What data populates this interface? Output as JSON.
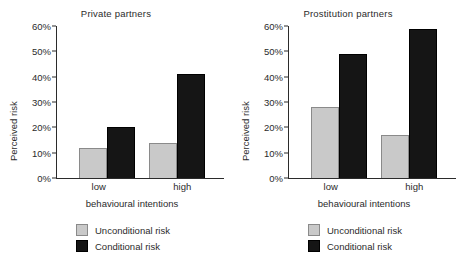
{
  "chart_data": [
    {
      "type": "bar",
      "title": "Private partners",
      "xlabel": "behavioural intentions",
      "ylabel": "Perceived risk",
      "categories": [
        "low",
        "high"
      ],
      "ylim": [
        0,
        60
      ],
      "yticks": [
        "0%",
        "10%",
        "20%",
        "30%",
        "40%",
        "50%",
        "60%"
      ],
      "ytick_values": [
        0,
        10,
        20,
        30,
        40,
        50,
        60
      ],
      "grid": false,
      "legend_position": "below",
      "series": [
        {
          "name": "Unconditional risk",
          "values": [
            12,
            14
          ],
          "color": "#c9c9c9"
        },
        {
          "name": "Conditional risk",
          "values": [
            20,
            41
          ],
          "color": "#151515"
        }
      ]
    },
    {
      "type": "bar",
      "title": "Prostitution partners",
      "xlabel": "behavioural intentions",
      "ylabel": "Perceived risk",
      "categories": [
        "low",
        "high"
      ],
      "ylim": [
        0,
        60
      ],
      "yticks": [
        "0%",
        "10%",
        "20%",
        "30%",
        "40%",
        "50%",
        "60%"
      ],
      "ytick_values": [
        0,
        10,
        20,
        30,
        40,
        50,
        60
      ],
      "grid": false,
      "legend_position": "below",
      "series": [
        {
          "name": "Unconditional risk",
          "values": [
            28,
            17
          ],
          "color": "#c9c9c9"
        },
        {
          "name": "Conditional risk",
          "values": [
            49,
            59
          ],
          "color": "#151515"
        }
      ]
    }
  ]
}
